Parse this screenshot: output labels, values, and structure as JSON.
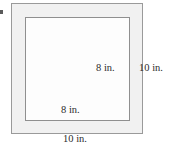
{
  "figure": {
    "colors": {
      "band_fill": "#f1f1f1",
      "inner_fill": "#fdfdfd",
      "stroke": "#9a9a9a",
      "text": "#2b2b2b",
      "background": "#ffffff"
    },
    "labels": {
      "inner_right": "8 in.",
      "outer_right": "10 in.",
      "inner_bottom": "8 in.",
      "outer_bottom": "10 in."
    },
    "shapes": {
      "outer_square": {
        "name": "outer-square",
        "side_label": "10 in."
      },
      "inner_square": {
        "name": "inner-square",
        "side_label": "8 in."
      }
    }
  },
  "chart_data": {
    "type": "diagram",
    "shapes": [
      {
        "name": "outer square",
        "side_length": 10,
        "units": "in.",
        "labeled_sides": [
          "right",
          "bottom"
        ],
        "fill": "light gray"
      },
      {
        "name": "inner square",
        "side_length": 8,
        "units": "in.",
        "labeled_sides": [
          "right",
          "bottom"
        ],
        "fill": "white"
      }
    ],
    "annotations": [
      "8 in.",
      "10 in.",
      "8 in.",
      "10 in."
    ]
  }
}
